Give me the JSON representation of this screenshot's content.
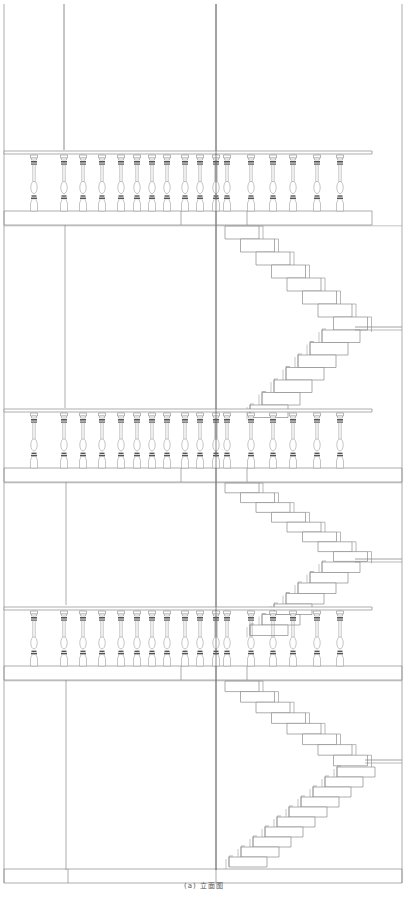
{
  "caption": "(a) 立面图",
  "colors": {
    "line": "#8a8a8a",
    "dark": "#6f6f6f",
    "fill": "#ffffff",
    "band": "#555555"
  },
  "frame": {
    "left_x": 4,
    "right_x": 402,
    "top_y": 4,
    "bottom_y": 883,
    "vertical_lines": [
      {
        "x": 64,
        "y1": 4,
        "y2": 150
      },
      {
        "x": 216,
        "y1": 4,
        "y2": 870
      }
    ]
  },
  "floors": [
    {
      "name": "floor-3",
      "rail_y": 151,
      "rail_x1": 4,
      "rail_x2": 372,
      "baluster_top": 155,
      "baluster_bottom": 211,
      "slab_y1": 211,
      "slab_y2": 225,
      "slab_x2": 372,
      "slab_joints": [
        181,
        247
      ],
      "wall_y1": 225,
      "wall_y2": 408,
      "wall_joints": [
        65
      ]
    },
    {
      "name": "floor-2",
      "rail_y": 409,
      "rail_x1": 4,
      "rail_x2": 372,
      "baluster_top": 413,
      "baluster_bottom": 468,
      "slab_y1": 468,
      "slab_y2": 482,
      "slab_x2": 402,
      "slab_joints": [
        181,
        247
      ],
      "wall_y1": 482,
      "wall_y2": 605,
      "wall_joints": [
        66
      ]
    },
    {
      "name": "floor-1",
      "rail_y": 607,
      "rail_x1": 4,
      "rail_x2": 372,
      "baluster_top": 611,
      "baluster_bottom": 666,
      "slab_y1": 666,
      "slab_y2": 680,
      "slab_x2": 402,
      "slab_joints": [
        181,
        247
      ],
      "wall_y1": 680,
      "wall_y2": 870,
      "wall_joints": [
        66
      ]
    }
  ],
  "ground": {
    "y1": 869,
    "y2": 883,
    "joints": [
      68,
      216
    ]
  },
  "balusters_x": [
    34,
    64,
    83,
    102,
    121,
    137,
    152,
    167,
    185,
    200,
    216,
    227,
    251,
    273,
    293,
    317,
    340
  ],
  "stairs": [
    {
      "name": "flight-upper-down",
      "x0": 225,
      "y0": 226,
      "dx": 15.5,
      "dy": 13,
      "steps": 8,
      "tread_w": 34,
      "dir": 1
    },
    {
      "name": "flight-upper-up",
      "x0": 360,
      "y0": 330,
      "dx": -12,
      "dy": 12.5,
      "steps": 7,
      "tread_w": 38,
      "dir": -1
    },
    {
      "name": "flight-middle-down",
      "x0": 225,
      "y0": 483,
      "dx": 15.5,
      "dy": 9.8,
      "steps": 8,
      "tread_w": 34,
      "dir": 1
    },
    {
      "name": "flight-middle-up",
      "x0": 360,
      "y0": 562,
      "dx": -12,
      "dy": 10.5,
      "steps": 7,
      "tread_w": 38,
      "dir": -1
    },
    {
      "name": "flight-lower-down",
      "x0": 225,
      "y0": 681,
      "dx": 15.5,
      "dy": 10.6,
      "steps": 8,
      "tread_w": 34,
      "dir": 1
    },
    {
      "name": "flight-lower-up",
      "x0": 375,
      "y0": 767,
      "dx": -12,
      "dy": 10,
      "steps": 10,
      "tread_w": 38,
      "dir": -1
    }
  ],
  "landings": [
    {
      "y": 327,
      "x1": 355,
      "x2": 402
    },
    {
      "y": 559,
      "x1": 355,
      "x2": 402
    },
    {
      "y": 760,
      "x1": 365,
      "x2": 402
    }
  ]
}
